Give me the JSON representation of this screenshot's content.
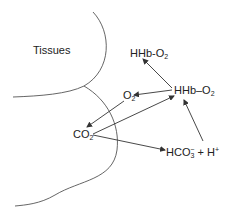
{
  "diagram": {
    "region_label": "Tissues",
    "nodes": {
      "hhb_o2_top": {
        "main": "HHb-O",
        "sub": "2"
      },
      "hhb_o2_right": {
        "main": "HHb–O",
        "sub": "2"
      },
      "o2": {
        "main": "O",
        "sub": "2"
      },
      "co2": {
        "main": "CO",
        "sub": "2"
      },
      "hco3": {
        "main": "HCO",
        "sub": "3",
        "sup": "−",
        "rest": " + H",
        "rest_sup": "+"
      }
    },
    "edges": [
      {
        "from": "HHb–O2",
        "to": "HHb-O2"
      },
      {
        "from": "HHb–O2",
        "to": "O2"
      },
      {
        "from": "O2",
        "to": "CO2"
      },
      {
        "from": "CO2",
        "to": "HHb–O2"
      },
      {
        "from": "CO2",
        "to": "HCO3- + H+"
      },
      {
        "from": "HCO3- + H+",
        "to": "HHb–O2"
      }
    ],
    "colors": {
      "line": "#333333",
      "text": "#222222"
    }
  }
}
